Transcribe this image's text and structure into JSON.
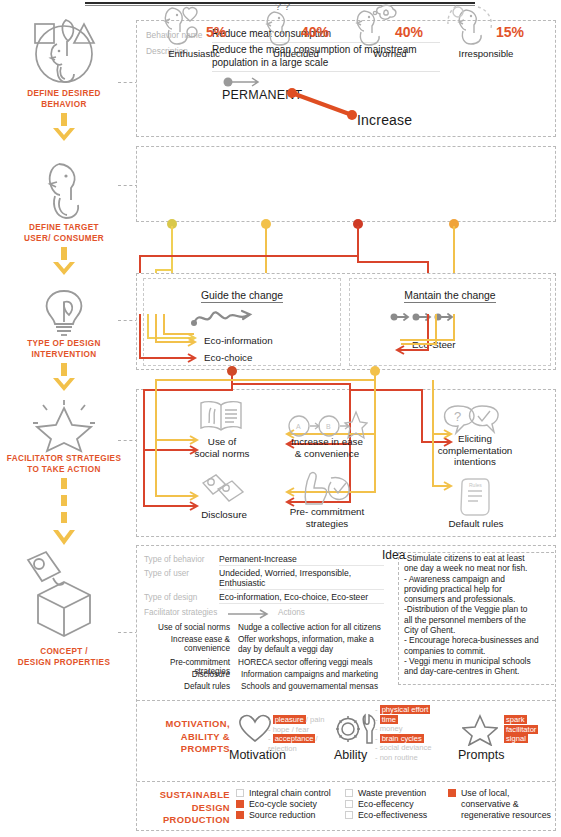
{
  "rail": {
    "steps": [
      {
        "label": "DEFINE DESIRED\nBEHAVIOR",
        "icon": "persona-shapes-icon",
        "label_line1": "DEFINE DESIRED",
        "label_line2": "BEHAVIOR"
      },
      {
        "label_line1": "DEFINE TARGET",
        "label_line2": "USER/ CONSUMER",
        "icon": "person-icon"
      },
      {
        "label_line1": "TYPE OF DESIGN",
        "label_line2": "INTERVENTION",
        "icon": "lightbulb-leaf-icon"
      },
      {
        "label_line1": "FACILITATOR STRATEGIES",
        "label_line2": "TO TAKE ACTION",
        "icon": "star-icon"
      },
      {
        "label_line1": "CONCEPT /",
        "label_line2": "DESIGN PROPERTIES",
        "icon": "cube-tag-icon"
      }
    ]
  },
  "behavior": {
    "key_name": "Behavior name",
    "value_name": "Reduce meat consumption",
    "key_description": "Description",
    "value_description_line1": "Reduce the mean consumption of mainstream",
    "value_description_line2": "population in a large scale",
    "permanent": "PERMANENT",
    "increase": "Increase"
  },
  "users": [
    {
      "name": "Enthusiastic",
      "pct": "5%",
      "icon": "person-heart-icon",
      "dot_color": "#d9c84a"
    },
    {
      "name": "Undecided",
      "pct": "40%",
      "icon": "person-question-icon",
      "dot_color": "#f2c14b"
    },
    {
      "name": "Worried",
      "pct": "40%",
      "icon": "person-thought-icon",
      "dot_color": "#cf3b25"
    },
    {
      "name": "Irresponsible",
      "pct": "15%",
      "icon": "person-dashed-icon",
      "dot_color": "#f0a33a"
    }
  ],
  "intervention": {
    "left": {
      "title": "Guide the change",
      "icon": "squiggle-arrow-icon",
      "items": [
        "Eco-information",
        "Eco-choice"
      ],
      "dot_color": "#cf4a28"
    },
    "right": {
      "title": "Mantain the change",
      "icon": "triple-arrow-icon",
      "items": [
        "Eco-Steer"
      ],
      "dot_color": "#f2c14b"
    }
  },
  "facilitator": {
    "items": [
      {
        "label_line1": "Use of",
        "label_line2": "social norms",
        "icon": "open-book-icon"
      },
      {
        "label_line1": "Disclosure",
        "label_line2": "",
        "icon": "tags-icon"
      },
      {
        "label_line1": "Increase in ease",
        "label_line2": "& convenience",
        "icon": "a-to-b-star-icon"
      },
      {
        "label_line1": "Pre- commitment",
        "label_line2": "strategies",
        "icon": "handshake-check-icon"
      },
      {
        "label_line1": "Eliciting",
        "label_line2": "complementation",
        "label_line3": "intentions",
        "icon": "question-check-bubbles-icon"
      },
      {
        "label_line1": "Default rules",
        "label_line2": "",
        "icon": "rules-card-icon"
      }
    ]
  },
  "concept": {
    "rows": [
      {
        "key": "Type of behavior",
        "value_line1": "Permanent-Increase",
        "value_line2": ""
      },
      {
        "key": "Type of user",
        "value_line1": "Undecided, Worried, Irresponsible,",
        "value_line2": "Enthusiastic"
      },
      {
        "key": "Type of design",
        "value_line1": "Eco-information, Eco-choice, Eco-steer",
        "value_line2": ""
      }
    ],
    "table_header_left": "Facilitator strategies",
    "table_header_right": "Actions",
    "strategies": [
      {
        "name": "Use of social norms",
        "action_line1": "Nudge a collective action for all citizens",
        "action_line2": ""
      },
      {
        "name": "Increase ease & convenience",
        "action_line1": "Offer  workshops, information, make a",
        "action_line2": "day by default a veggi day"
      },
      {
        "name": "Pre-commitment strategies",
        "action_line1": "HORECA sector offering veggi meals",
        "action_line2": ""
      },
      {
        "name": "Disclosure",
        "action_line1": "Information campaigns and marketing",
        "action_line2": ""
      },
      {
        "name": "Default rules",
        "action_line1": "Schools and gouvernamental mensas",
        "action_line2": ""
      }
    ],
    "idea_title": "Idea",
    "idea_lines": [
      "-Stimulate citizens to eat at least",
      "one day a week no meat nor fish.",
      "- Awareness campaign and",
      "providing practical help for",
      "consumers and professionals.",
      "-Distribution of the Veggie plan to",
      "all the personnel members of the",
      "City of Ghent.",
      "- Encourage horeca-businesses and",
      "companies to commit.",
      "- Veggi menu in municipal schools",
      "and day-care-centres in Ghent."
    ]
  },
  "map": {
    "head_line1": "MOTIVATION,",
    "head_line2": "ABILITY &",
    "head_line3": "PROMPTS",
    "motivation": {
      "label": "Motivation",
      "icon": "heart-icon",
      "items": [
        {
          "text": "pleasure",
          "highlight": true,
          "tail": "/ pain"
        },
        {
          "text": "hope / fear",
          "highlight": false,
          "tail": ""
        },
        {
          "text": "acceptance",
          "highlight": true,
          "tail": "/"
        },
        {
          "text": "rejection",
          "highlight": false,
          "tail": ""
        }
      ]
    },
    "ability": {
      "label": "Ability",
      "icon": "gear-wrench-icon",
      "items": [
        {
          "text": "physical effort",
          "highlight": true,
          "tail": ""
        },
        {
          "text": "time",
          "highlight": true,
          "tail": ""
        },
        {
          "text": "money",
          "highlight": false,
          "tail": ""
        },
        {
          "text": "brain cycles",
          "highlight": true,
          "tail": ""
        },
        {
          "text": "social deviance",
          "highlight": false,
          "tail": ""
        },
        {
          "text": "non routine",
          "highlight": false,
          "tail": ""
        }
      ]
    },
    "prompts": {
      "label": "Prompts",
      "icon": "star-outline-icon",
      "items": [
        {
          "text": "spark",
          "highlight": true,
          "tail": ""
        },
        {
          "text": "facilitator",
          "highlight": true,
          "tail": ""
        },
        {
          "text": "signal",
          "highlight": true,
          "tail": ""
        }
      ]
    }
  },
  "sustainable": {
    "head_line1": "SUSTAINABLE",
    "head_line2": "DESIGN",
    "head_line3": "PRODUCTION",
    "col1": [
      {
        "label": "Integral chain control",
        "checked": false
      },
      {
        "label": "Eco-cycle society",
        "checked": true
      },
      {
        "label": "Source reduction",
        "checked": true
      }
    ],
    "col2": [
      {
        "label": "Waste prevention",
        "checked": false
      },
      {
        "label": "Eco-effecency",
        "checked": false
      },
      {
        "label": "Eco-effectiveness",
        "checked": false
      }
    ],
    "col3": [
      {
        "label_line1": "Use of local,",
        "label_line2": "conservative &",
        "label_line3": "regenerative resources",
        "checked": true
      }
    ]
  },
  "colors": {
    "accent_orange": "#e2532a",
    "deep_red": "#cf3b25",
    "yellow": "#f2c14b",
    "gray_line": "#b9b9b9",
    "icon_gray": "#9a9a9a"
  }
}
